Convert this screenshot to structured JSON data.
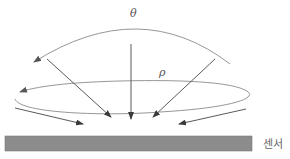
{
  "diagram": {
    "type": "physics-illustration",
    "labels": {
      "theta": "θ",
      "rho": "ρ",
      "sensor": "센서"
    },
    "colors": {
      "line": "#6a6a6a",
      "arc": "#8a8a8a",
      "sensor_fill": "#8c8c8c",
      "sensor_edge": "#7a7a7a",
      "background": "#ffffff"
    },
    "elements": {
      "theta_arc": {
        "description": "curved arrow indicating polar angle θ, sweeping right to left"
      },
      "rho_ellipse": {
        "description": "elliptical arrow indicating azimuthal rotation ρ"
      },
      "incident_rays": {
        "count": 5,
        "description": "arrows converging toward a point on the sensor surface"
      },
      "sensor": {
        "description": "flat grey sensor plate"
      }
    }
  }
}
